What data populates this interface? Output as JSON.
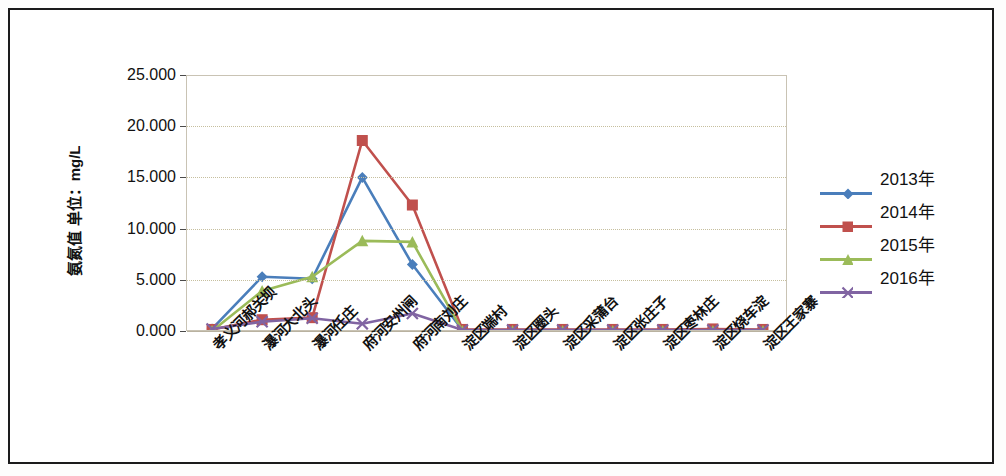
{
  "chart_data": {
    "type": "line",
    "title": "",
    "xlabel": "",
    "ylabel": "氨氮值 单位：mg/L",
    "ylim": [
      0,
      25
    ],
    "ytick_labels": [
      "25.000",
      "20.000",
      "15.000",
      "10.000",
      "5.000",
      "0.000"
    ],
    "ytick_values": [
      25,
      20,
      15,
      10,
      5,
      0
    ],
    "grid": true,
    "legend_position": "right",
    "categories": [
      "孝义河郝关坝",
      "瀑河大北头",
      "瀑河任庄",
      "府河安州闸",
      "府河南刘庄",
      "淀区端村",
      "淀区圈头",
      "淀区采蒲台",
      "淀区张庄子",
      "淀区枣林庄",
      "淀区烧车淀",
      "淀区王家寨"
    ],
    "series": [
      {
        "name": "2013年",
        "color": "#4a7ebb",
        "marker": "diamond",
        "values": [
          0.3,
          5.4,
          5.2,
          15.1,
          6.6,
          0.2,
          0.15,
          0.15,
          0.15,
          0.15,
          0.15,
          0.15
        ]
      },
      {
        "name": "2014年",
        "color": "#c0504d",
        "marker": "square",
        "values": [
          0.25,
          1.2,
          1.4,
          18.7,
          12.4,
          0.25,
          0.25,
          0.25,
          0.25,
          0.25,
          0.3,
          0.25
        ]
      },
      {
        "name": "2015年",
        "color": "#9bbb59",
        "marker": "triangle",
        "values": [
          0.1,
          4.0,
          5.4,
          8.9,
          8.8,
          0.1,
          0.1,
          0.1,
          0.1,
          0.1,
          0.1,
          0.1
        ]
      },
      {
        "name": "2016年",
        "color": "#8064a2",
        "marker": "x",
        "values": [
          0.3,
          1.0,
          1.35,
          0.8,
          1.8,
          0.2,
          0.2,
          0.2,
          0.2,
          0.2,
          0.2,
          0.2
        ]
      }
    ]
  },
  "legend": {
    "entries": [
      {
        "label": "2013年",
        "color": "#4a7ebb",
        "marker": "diamond"
      },
      {
        "label": "2014年",
        "color": "#c0504d",
        "marker": "square"
      },
      {
        "label": "2015年",
        "color": "#9bbb59",
        "marker": "triangle"
      },
      {
        "label": "2016年",
        "color": "#8064a2",
        "marker": "x"
      }
    ]
  }
}
